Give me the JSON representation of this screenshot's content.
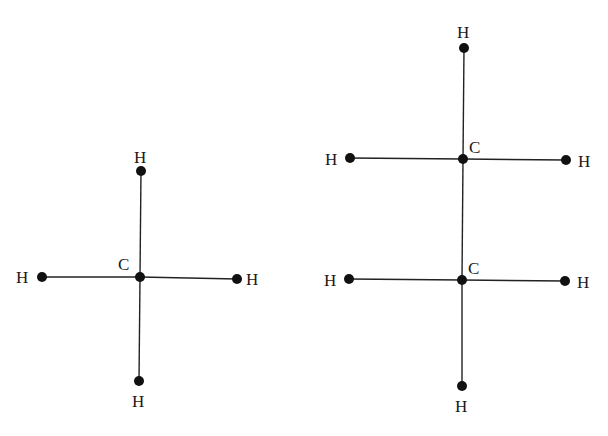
{
  "diagram": {
    "type": "structural-formulas",
    "molecules": [
      {
        "name": "methane",
        "atoms": [
          {
            "id": "C1",
            "label": "C",
            "x": 140,
            "y": 277,
            "label_x": 118,
            "label_y": 270
          },
          {
            "id": "H1",
            "label": "H",
            "x": 141,
            "y": 171,
            "label_x": 134,
            "label_y": 163
          },
          {
            "id": "H2",
            "label": "H",
            "x": 139,
            "y": 381,
            "label_x": 132,
            "label_y": 407
          },
          {
            "id": "H3",
            "label": "H",
            "x": 42,
            "y": 277,
            "label_x": 16,
            "label_y": 283
          },
          {
            "id": "H4",
            "label": "H",
            "x": 237,
            "y": 279,
            "label_x": 246,
            "label_y": 285
          }
        ],
        "bonds": [
          [
            "C1",
            "H1"
          ],
          [
            "C1",
            "H2"
          ],
          [
            "C1",
            "H3"
          ],
          [
            "C1",
            "H4"
          ]
        ]
      },
      {
        "name": "ethane",
        "atoms": [
          {
            "id": "C1",
            "label": "C",
            "x": 463,
            "y": 159,
            "label_x": 469,
            "label_y": 153
          },
          {
            "id": "C2",
            "label": "C",
            "x": 462,
            "y": 280,
            "label_x": 468,
            "label_y": 274
          },
          {
            "id": "H1",
            "label": "H",
            "x": 464,
            "y": 48,
            "label_x": 457,
            "label_y": 38
          },
          {
            "id": "H2",
            "label": "H",
            "x": 350,
            "y": 158,
            "label_x": 325,
            "label_y": 165
          },
          {
            "id": "H3",
            "label": "H",
            "x": 566,
            "y": 160,
            "label_x": 578,
            "label_y": 167
          },
          {
            "id": "H4",
            "label": "H",
            "x": 349,
            "y": 279,
            "label_x": 324,
            "label_y": 286
          },
          {
            "id": "H5",
            "label": "H",
            "x": 565,
            "y": 281,
            "label_x": 577,
            "label_y": 288
          },
          {
            "id": "H6",
            "label": "H",
            "x": 462,
            "y": 386,
            "label_x": 455,
            "label_y": 412
          }
        ],
        "bonds": [
          [
            "C1",
            "C2"
          ],
          [
            "C1",
            "H1"
          ],
          [
            "C1",
            "H2"
          ],
          [
            "C1",
            "H3"
          ],
          [
            "C2",
            "H4"
          ],
          [
            "C2",
            "H5"
          ],
          [
            "C2",
            "H6"
          ]
        ]
      }
    ]
  }
}
